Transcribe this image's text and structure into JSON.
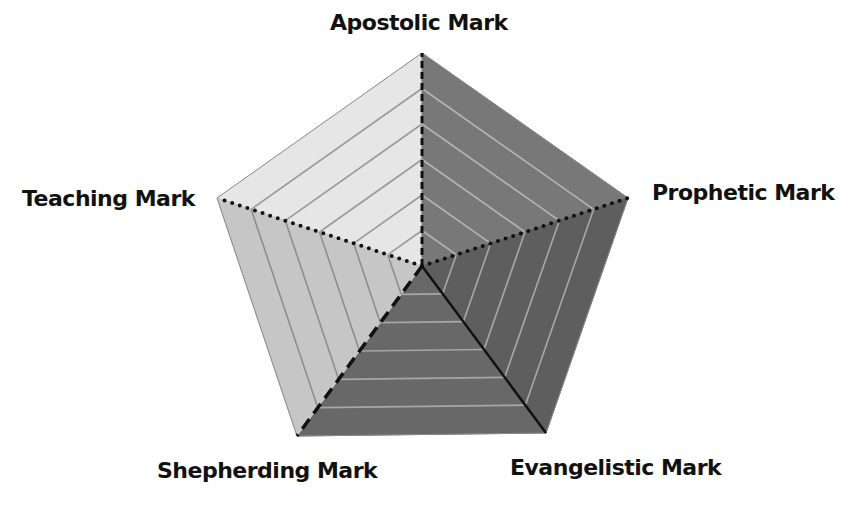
{
  "diagram": {
    "type": "pentagon-radar",
    "labels": {
      "apostolic": "Apostolic Mark",
      "prophetic": "Prophetic Mark",
      "evangelistic": "Evangelistic Mark",
      "shepherding": "Shepherding Mark",
      "teaching": "Teaching Mark"
    },
    "center": [
      422,
      266
    ],
    "vertices": {
      "apostolic": [
        422,
        53
      ],
      "prophetic": [
        628,
        198
      ],
      "evangelistic": [
        546,
        433
      ],
      "shepherding": [
        297,
        436
      ],
      "teaching": [
        217,
        198
      ]
    },
    "sectors": [
      {
        "name": "teaching-apostolic",
        "from": "teaching",
        "to": "apostolic",
        "fill": "#e6e6e6",
        "stripe": "#9a9a9a"
      },
      {
        "name": "apostolic-prophetic",
        "from": "apostolic",
        "to": "prophetic",
        "fill": "#787878",
        "stripe": "#b4b4b4"
      },
      {
        "name": "prophetic-evangelistic",
        "from": "prophetic",
        "to": "evangelistic",
        "fill": "#5e5e5e",
        "stripe": "#a8a8a8"
      },
      {
        "name": "evangelistic-shepherding",
        "from": "evangelistic",
        "to": "shepherding",
        "fill": "#686868",
        "stripe": "#a6a6a6"
      },
      {
        "name": "shepherding-teaching",
        "from": "shepherding",
        "to": "teaching",
        "fill": "#c6c6c6",
        "stripe": "#8e8e8e"
      }
    ],
    "rings": 6,
    "spokes": [
      {
        "to": "apostolic",
        "style": "dashed"
      },
      {
        "to": "prophetic",
        "style": "dotted"
      },
      {
        "to": "evangelistic",
        "style": "solid"
      },
      {
        "to": "shepherding",
        "style": "long-dashed"
      },
      {
        "to": "teaching",
        "style": "dotted"
      }
    ]
  }
}
